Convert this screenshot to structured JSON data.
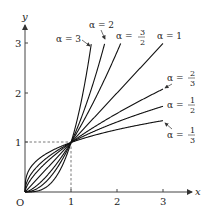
{
  "chart_data": {
    "type": "line",
    "title": "",
    "xlabel": "x",
    "ylabel": "y",
    "origin_label": "O",
    "x_ticks": [
      "1",
      "2",
      "3"
    ],
    "y_ticks": [
      "1",
      "2",
      "3"
    ],
    "xlim": [
      0,
      3.4
    ],
    "ylim": [
      0,
      3.4
    ],
    "grid": false,
    "function": "y = x^alpha",
    "reference_point": {
      "x": 1,
      "y": 1,
      "dashed_guides": true
    },
    "series": [
      {
        "name": "α = 3",
        "alpha": 3,
        "label": "α = 3"
      },
      {
        "name": "α = 2",
        "alpha": 2,
        "label": "α = 2"
      },
      {
        "name": "α = 3/2",
        "alpha": 1.5,
        "label": "α = 3/2"
      },
      {
        "name": "α = 1",
        "alpha": 1,
        "label": "α = 1"
      },
      {
        "name": "α = 2/3",
        "alpha": 0.6667,
        "label": "α = 2/3"
      },
      {
        "name": "α = 1/2",
        "alpha": 0.5,
        "label": "α = 1/2"
      },
      {
        "name": "α = 1/3",
        "alpha": 0.3333,
        "label": "α = 1/3"
      }
    ]
  },
  "labels": {
    "y_axis": "y",
    "x_axis": "x",
    "origin": "O",
    "t1": "1",
    "t2": "2",
    "t3": "3",
    "alpha_sym": "α =",
    "a3": "3",
    "a2": "2",
    "a1": "1",
    "f32_num": "3",
    "f32_den": "2",
    "f23_num": "2",
    "f23_den": "3",
    "f12_num": "1",
    "f12_den": "2",
    "f13_num": "1",
    "f13_den": "3"
  }
}
